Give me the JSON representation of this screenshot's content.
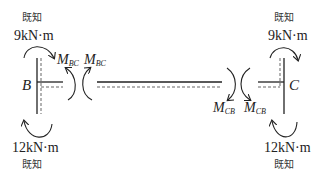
{
  "diagram": {
    "joint_b": {
      "label": "B",
      "top_moment": {
        "value": "9kN·m",
        "note": "既知",
        "direction": "clockwise"
      },
      "bottom_moment": {
        "value": "12kN·m",
        "note": "既知",
        "direction": "clockwise"
      },
      "end_moment": {
        "name": "M",
        "subscript": "BC"
      }
    },
    "joint_c": {
      "label": "C",
      "top_moment": {
        "value": "9kN·m",
        "note": "既知",
        "direction": "clockwise"
      },
      "bottom_moment": {
        "value": "12kN·m",
        "note": "既知",
        "direction": "clockwise"
      },
      "end_moment": {
        "name": "M",
        "subscript": "CB"
      }
    },
    "beam": {
      "left_end_moment": {
        "name": "M",
        "subscript": "BC"
      },
      "right_end_moment": {
        "name": "M",
        "subscript": "CB"
      }
    },
    "colors": {
      "line": "#222222",
      "dashed": "#555555"
    }
  }
}
